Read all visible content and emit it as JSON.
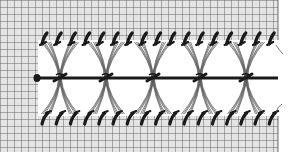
{
  "illustration": {
    "title": "Hemstitch drawn-thread embroidery diagram",
    "subject": "needlework-diagram",
    "colors": {
      "background": "#ffffff",
      "fabric_fill": "#e4e4e4",
      "grid_line": "#5a5a5a",
      "thread": "#1a1a1a",
      "loose_thread": "#555555"
    },
    "grid_spacing_px": 7,
    "fabric_right_edge_px": 278,
    "drawn_area": {
      "x": 38,
      "y": 40,
      "width": 240,
      "height": 76
    },
    "center_thread_y": 78,
    "knot_positions_x": [
      60,
      106,
      153,
      200,
      246
    ],
    "top_stitch_count": 17,
    "bottom_stitch_count": 17
  }
}
